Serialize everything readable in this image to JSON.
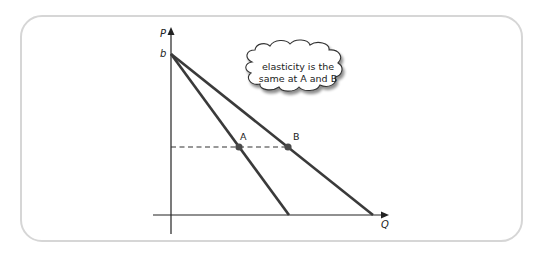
{
  "diagram": {
    "axes": {
      "y_label": "P",
      "x_label": "Q",
      "intercept_label": "b"
    },
    "points": [
      {
        "label": "A"
      },
      {
        "label": "B"
      }
    ],
    "callout": {
      "line1": "elasticity is the",
      "line2": "same at A and B"
    },
    "colors": {
      "line": "#3a3a3a",
      "axis": "#222222",
      "point": "#4a4a4a",
      "panel_border": "#d6d6d6"
    }
  }
}
